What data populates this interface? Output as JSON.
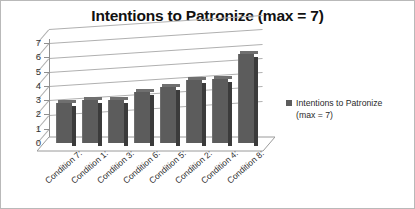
{
  "chart_data": {
    "type": "bar",
    "title": "Intentions to Patronize (max = 7)",
    "xlabel": "",
    "ylabel": "",
    "ylim": [
      0,
      7
    ],
    "yticks": [
      "0",
      "1",
      "2",
      "3",
      "4",
      "5",
      "6",
      "7"
    ],
    "grid": true,
    "legend_position": "right",
    "categories": [
      "Condition 7:",
      "Condition 1:",
      "Condition 3:",
      "Condition 6:",
      "Condition 5:",
      "Condition 2:",
      "Condition 4:",
      "Condition 8:"
    ],
    "values": [
      2.8,
      3.0,
      3.0,
      3.6,
      3.9,
      4.4,
      4.5,
      6.2
    ],
    "series": [
      {
        "name": "Intentions to Patronize (max = 7)",
        "values": [
          2.8,
          3.0,
          3.0,
          3.6,
          3.9,
          4.4,
          4.5,
          6.2
        ]
      }
    ],
    "bar_color": "#5c5c5c",
    "gridline_color": "#b0b0b0"
  },
  "legend": {
    "line1": "Intentions to Patronize",
    "line2": "(max = 7)",
    "swatch_icon": "square-marker-icon"
  }
}
